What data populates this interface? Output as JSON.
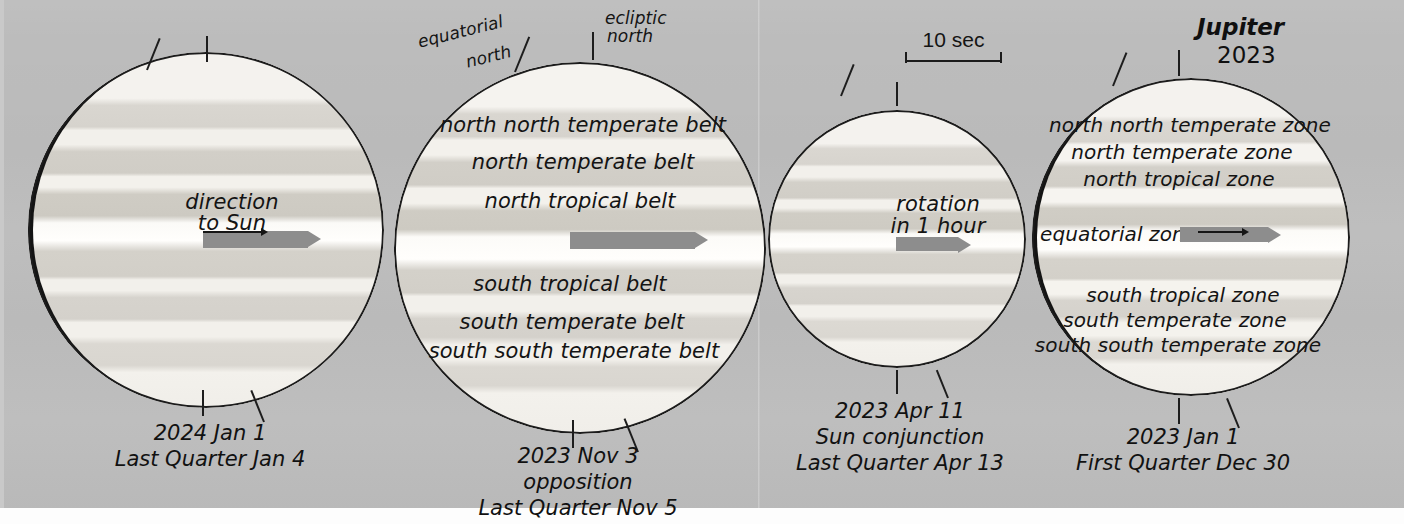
{
  "title": {
    "name": "Jupiter",
    "year": "2023"
  },
  "scale": {
    "label": "10 sec"
  },
  "pole_labels": {
    "equatorial_north": "equatorial\nnorth",
    "equatorial_north_line1": "equatorial",
    "equatorial_north_line2": "north",
    "ecliptic_north_line1": "ecliptic",
    "ecliptic_north_line2": "north"
  },
  "disks": [
    {
      "id": "disk-2024-jan-1",
      "caption_lines": [
        "2024 Jan 1",
        "Last Quarter Jan 4"
      ],
      "inner_label_lines": [
        "direction",
        "to Sun"
      ],
      "has_terminator": true,
      "arrow": "direction-to-sun"
    },
    {
      "id": "disk-2023-nov-3",
      "caption_lines": [
        "2023 Nov 3",
        "opposition",
        "Last Quarter Nov 5"
      ],
      "belt_labels": [
        "north north temperate belt",
        "north temperate belt",
        "north tropical belt",
        "south tropical belt",
        "south temperate belt",
        "south south temperate belt"
      ],
      "has_terminator": false,
      "arrow": "equatorial-arrow"
    },
    {
      "id": "disk-2023-apr-11",
      "caption_lines": [
        "2023 Apr 11",
        "Sun conjunction",
        "Last Quarter Apr 13"
      ],
      "inner_label_lines": [
        "rotation",
        "in 1 hour"
      ],
      "has_terminator": false,
      "arrow": "rotation-arrow"
    },
    {
      "id": "disk-2023-jan-1",
      "caption_lines": [
        "2023 Jan 1",
        "First Quarter Dec 30"
      ],
      "zone_labels": [
        "north north temperate zone",
        "north temperate zone",
        "north tropical zone",
        "equatorial zone",
        "south tropical zone",
        "south temperate zone",
        "south south temperate zone"
      ],
      "has_terminator": true,
      "arrow": "equatorial-zone-arrow"
    }
  ],
  "colors": {
    "background": "#bcbcbc",
    "disk_light": "#f2f0ec",
    "belt": "#d5d2cc",
    "rim": "#1c1c1c",
    "arrow_gray": "#8d8d8d",
    "text": "#141414"
  }
}
